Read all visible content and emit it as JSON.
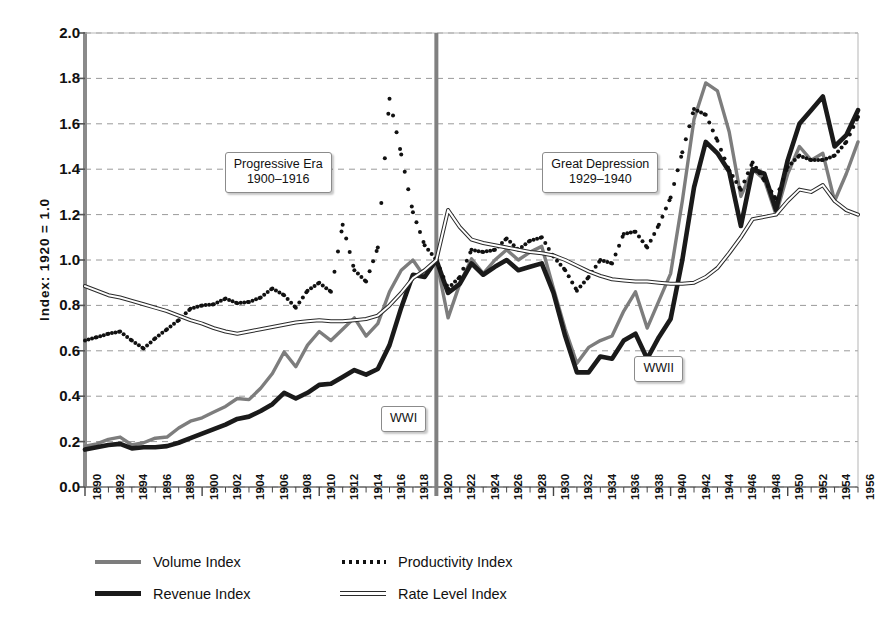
{
  "chart_data": {
    "type": "line",
    "title": "",
    "xlabel": "",
    "ylabel": "Index: 1920 = 1.0",
    "xlim": [
      1890,
      1956
    ],
    "ylim": [
      0.0,
      2.0
    ],
    "grid": true,
    "legend_position": "below",
    "ytick_labels": [
      "2.0",
      "1.8",
      "1.6",
      "1.4",
      "1.2",
      "1.0",
      "0.8",
      "0.6",
      "0.4",
      "0.2",
      "0.0"
    ],
    "ytick_values": [
      2.0,
      1.8,
      1.6,
      1.4,
      1.2,
      1.0,
      0.8,
      0.6,
      0.4,
      0.2,
      0.0
    ],
    "xtick_labels": [
      "1890",
      "1892",
      "1894",
      "1896",
      "1898",
      "1900",
      "1902",
      "1904",
      "1906",
      "1908",
      "1910",
      "1912",
      "1914",
      "1916",
      "1918",
      "1920",
      "1922",
      "1924",
      "1926",
      "1928",
      "1930",
      "1932",
      "1934",
      "1936",
      "1938",
      "1940",
      "1942",
      "1944",
      "1946",
      "1948",
      "1950",
      "1952",
      "1954",
      "1956"
    ],
    "x": [
      1890,
      1891,
      1892,
      1893,
      1894,
      1895,
      1896,
      1897,
      1898,
      1899,
      1900,
      1901,
      1902,
      1903,
      1904,
      1905,
      1906,
      1907,
      1908,
      1909,
      1910,
      1911,
      1912,
      1913,
      1914,
      1915,
      1916,
      1917,
      1918,
      1919,
      1920,
      1921,
      1922,
      1923,
      1924,
      1925,
      1926,
      1927,
      1928,
      1929,
      1930,
      1931,
      1932,
      1933,
      1934,
      1935,
      1936,
      1937,
      1938,
      1939,
      1940,
      1941,
      1942,
      1943,
      1944,
      1945,
      1946,
      1947,
      1948,
      1949,
      1950,
      1951,
      1952,
      1953,
      1954,
      1955,
      1956
    ],
    "series": [
      {
        "name": "Volume Index",
        "color": "#7d7d7d",
        "style": "solid-medium",
        "values": [
          0.18,
          0.19,
          0.21,
          0.22,
          0.185,
          0.195,
          0.215,
          0.22,
          0.26,
          0.29,
          0.305,
          0.33,
          0.355,
          0.39,
          0.385,
          0.435,
          0.5,
          0.595,
          0.53,
          0.625,
          0.685,
          0.645,
          0.695,
          0.745,
          0.665,
          0.72,
          0.86,
          0.955,
          1.0,
          0.925,
          1.0,
          0.745,
          0.895,
          1.005,
          0.94,
          1.0,
          1.045,
          1.0,
          1.035,
          1.06,
          0.875,
          0.695,
          0.545,
          0.615,
          0.645,
          0.665,
          0.775,
          0.86,
          0.7,
          0.82,
          0.94,
          1.26,
          1.62,
          1.78,
          1.745,
          1.565,
          1.28,
          1.4,
          1.355,
          1.2,
          1.38,
          1.5,
          1.44,
          1.47,
          1.26,
          1.38,
          1.52
        ]
      },
      {
        "name": "Revenue Index",
        "color": "#1a1a1a",
        "style": "solid-thick",
        "values": [
          0.165,
          0.175,
          0.185,
          0.19,
          0.17,
          0.175,
          0.175,
          0.18,
          0.195,
          0.215,
          0.235,
          0.255,
          0.275,
          0.3,
          0.31,
          0.335,
          0.365,
          0.415,
          0.39,
          0.415,
          0.45,
          0.455,
          0.485,
          0.515,
          0.495,
          0.52,
          0.625,
          0.79,
          0.935,
          0.925,
          1.0,
          0.855,
          0.895,
          0.985,
          0.935,
          0.97,
          1.0,
          0.955,
          0.97,
          0.985,
          0.855,
          0.665,
          0.505,
          0.505,
          0.575,
          0.565,
          0.645,
          0.675,
          0.565,
          0.66,
          0.74,
          1.0,
          1.32,
          1.52,
          1.47,
          1.39,
          1.15,
          1.4,
          1.38,
          1.22,
          1.44,
          1.6,
          1.66,
          1.72,
          1.5,
          1.55,
          1.66
        ]
      },
      {
        "name": "Productivity Index",
        "color": "#111111",
        "style": "dotted",
        "values": [
          0.645,
          0.66,
          0.675,
          0.685,
          0.645,
          0.61,
          0.655,
          0.695,
          0.735,
          0.785,
          0.8,
          0.805,
          0.83,
          0.81,
          0.815,
          0.835,
          0.875,
          0.845,
          0.79,
          0.865,
          0.9,
          0.86,
          1.155,
          0.955,
          0.905,
          1.055,
          1.71,
          1.465,
          1.21,
          1.065,
          1.0,
          0.875,
          0.925,
          1.045,
          1.035,
          1.045,
          1.095,
          1.045,
          1.085,
          1.1,
          1.015,
          0.955,
          0.865,
          0.925,
          1.0,
          0.985,
          1.115,
          1.125,
          1.055,
          1.155,
          1.275,
          1.475,
          1.665,
          1.64,
          1.525,
          1.395,
          1.31,
          1.43,
          1.35,
          1.27,
          1.41,
          1.46,
          1.44,
          1.44,
          1.46,
          1.52,
          1.63
        ]
      },
      {
        "name": "Rate Level Index",
        "color": "#2a2a2a",
        "style": "double-thin",
        "values": [
          0.885,
          0.865,
          0.845,
          0.835,
          0.82,
          0.805,
          0.79,
          0.775,
          0.755,
          0.735,
          0.72,
          0.7,
          0.685,
          0.675,
          0.685,
          0.695,
          0.705,
          0.715,
          0.725,
          0.73,
          0.735,
          0.73,
          0.73,
          0.735,
          0.74,
          0.755,
          0.8,
          0.855,
          0.92,
          0.955,
          1.0,
          1.22,
          1.145,
          1.09,
          1.075,
          1.065,
          1.055,
          1.045,
          1.035,
          1.03,
          1.02,
          1.0,
          0.975,
          0.95,
          0.93,
          0.915,
          0.91,
          0.905,
          0.905,
          0.9,
          0.895,
          0.895,
          0.9,
          0.925,
          0.965,
          1.03,
          1.1,
          1.18,
          1.19,
          1.2,
          1.26,
          1.31,
          1.3,
          1.33,
          1.26,
          1.22,
          1.2
        ]
      }
    ],
    "annotations": [
      {
        "name": "progressive-era",
        "lines": [
          "Progressive Era",
          "1900–1916"
        ],
        "x": 1906.5,
        "y": 1.385
      },
      {
        "name": "great-depression",
        "lines": [
          "Great Depression",
          "1929–1940"
        ],
        "x": 1934.0,
        "y": 1.385
      },
      {
        "name": "wwi",
        "lines": [
          "WWI"
        ],
        "x": 1917.2,
        "y": 0.3
      },
      {
        "name": "wwii",
        "lines": [
          "WWII"
        ],
        "x": 1939.0,
        "y": 0.52
      }
    ],
    "vertical_marker": {
      "name": "year-1920-marker",
      "x": 1920,
      "color": "#808080"
    }
  }
}
